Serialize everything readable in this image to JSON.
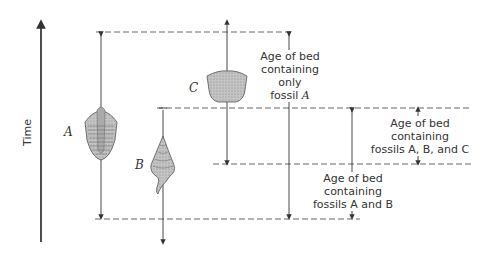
{
  "axis": {
    "label": "Time",
    "direction": "up"
  },
  "fossils": [
    {
      "id": "A",
      "letter": "A",
      "name": "trilobite"
    },
    {
      "id": "B",
      "letter": "B",
      "name": "gastropod"
    },
    {
      "id": "C",
      "letter": "C",
      "name": "crinoid-calyx"
    }
  ],
  "annotations": {
    "only_a": {
      "line1": "Age of bed",
      "line2": "containing only",
      "line3_prefix": "fossil ",
      "line3_italic": "A"
    },
    "abc": {
      "line1": "Age of bed",
      "line2": "containing",
      "line3": "fossils A, B, and C"
    },
    "ab": {
      "line1": "Age of bed",
      "line2": "containing",
      "line3": "fossils A and B"
    }
  },
  "colors": {
    "line": "#333333",
    "dash": "#555555",
    "fossil_fill": "#b8b8b8"
  }
}
